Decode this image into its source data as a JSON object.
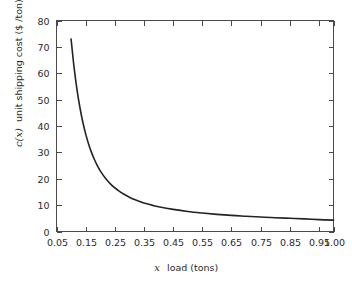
{
  "chart_data": {
    "type": "line",
    "title": "",
    "xlabel": "x  load (tons)",
    "xlabel_symbol": "x",
    "xlabel_rest": "load (tons)",
    "ylabel": "c(x)  unit shipping cost  ($ /ton)",
    "ylabel_symbol": "c(x)",
    "ylabel_rest": "unit shipping cost  ($ /ton)",
    "xlim": [
      0.05,
      1.0
    ],
    "ylim": [
      0,
      80
    ],
    "grid": false,
    "legend": "none",
    "xticks": [
      "0.05",
      "0.15",
      "0.25",
      "0.35",
      "0.45",
      "0.55",
      "0.65",
      "0.75",
      "0.85",
      "0.95",
      "1.00"
    ],
    "xtick_values": [
      0.05,
      0.15,
      0.25,
      0.35,
      0.45,
      0.55,
      0.65,
      0.75,
      0.85,
      0.95,
      1.0
    ],
    "yticks": [
      "0",
      "10",
      "20",
      "30",
      "40",
      "50",
      "60",
      "70",
      "80"
    ],
    "ytick_values": [
      0,
      10,
      20,
      30,
      40,
      50,
      60,
      70,
      80
    ],
    "series": [
      {
        "name": "unit shipping cost",
        "color": "#232323",
        "x": [
          0.1,
          0.11,
          0.12,
          0.13,
          0.14,
          0.15,
          0.16,
          0.17,
          0.18,
          0.19,
          0.2,
          0.22,
          0.24,
          0.26,
          0.28,
          0.3,
          0.32,
          0.34,
          0.36,
          0.38,
          0.4,
          0.45,
          0.5,
          0.55,
          0.6,
          0.65,
          0.7,
          0.75,
          0.8,
          0.85,
          0.9,
          0.95,
          1.0
        ],
        "y": [
          73.0,
          62.5,
          54.0,
          47.2,
          41.6,
          37.0,
          33.2,
          30.0,
          27.3,
          25.0,
          23.0,
          19.9,
          17.5,
          15.7,
          14.2,
          13.0,
          12.0,
          11.2,
          10.5,
          9.9,
          9.4,
          8.4,
          7.6,
          7.0,
          6.5,
          6.1,
          5.8,
          5.5,
          5.2,
          5.0,
          4.8,
          4.5,
          4.3
        ]
      }
    ]
  },
  "figure": {
    "background_color": "#ffffff",
    "axis_color": "#4a4a4a",
    "text_color": "#2b2b2b"
  }
}
